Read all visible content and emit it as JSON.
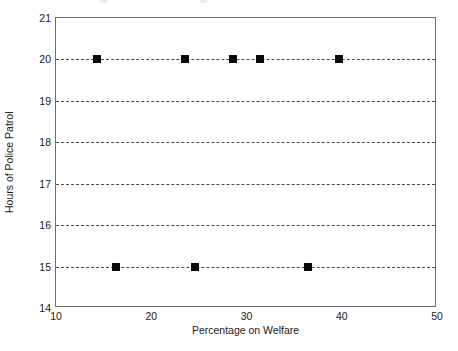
{
  "chart_data": {
    "type": "scatter",
    "title": "",
    "xlabel": "Percentage on Welfare",
    "ylabel": "Hours of Police Patrol",
    "xlim": [
      10,
      50
    ],
    "ylim": [
      14,
      21
    ],
    "xticks": [
      10,
      20,
      30,
      40,
      50
    ],
    "xtick_labels": [
      "10",
      "20",
      "30",
      "40",
      "50"
    ],
    "yticks": [
      14,
      15,
      16,
      17,
      18,
      19,
      20,
      21
    ],
    "ytick_labels": [
      "14",
      "15",
      "16",
      "17",
      "18",
      "19",
      "20",
      "21"
    ],
    "grid": "horizontal-dashed",
    "gridlines_y": [
      15,
      16,
      17,
      18,
      19,
      20
    ],
    "legend": "none",
    "marker_style": "filled-square",
    "marker_color": "#0a0a0a",
    "grid_color": "#4a4a4a",
    "frame_color": "#6e6e6e",
    "background": "#ffffff",
    "series": [
      {
        "name": "Observations",
        "points": [
          {
            "x": 14.3,
            "y": 20
          },
          {
            "x": 16.3,
            "y": 15
          },
          {
            "x": 23.5,
            "y": 20
          },
          {
            "x": 24.6,
            "y": 15
          },
          {
            "x": 28.6,
            "y": 20
          },
          {
            "x": 31.4,
            "y": 20
          },
          {
            "x": 36.5,
            "y": 15
          },
          {
            "x": 39.7,
            "y": 20
          }
        ]
      }
    ]
  }
}
